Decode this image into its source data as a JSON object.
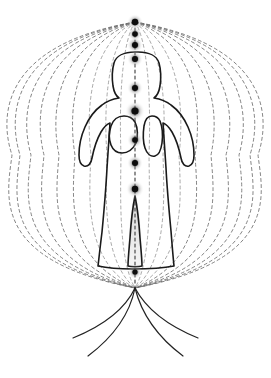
{
  "document": {
    "title": "Human Energy Field Diagram",
    "background_color": "#ffffff",
    "width": 271,
    "height": 378
  },
  "colors": {
    "figure_outline": "#1a1a1a",
    "field_line": "#6e6e6e",
    "inner_field_line": "#8a8a8a",
    "axis_line": "#3a3a3a",
    "node_core": "#0d0d0d",
    "node_glow": "#b5b5b5",
    "grounding_line": "#232323",
    "inner_beam": "#d8d8d8"
  },
  "canvas": {
    "center_x": 135,
    "top_pole": {
      "x": 135,
      "y": 22
    },
    "bottom_pole": {
      "x": 135,
      "y": 288
    }
  },
  "figure": {
    "name": "standing-human-silhouette",
    "pose": "arms akimbo, hands on hips",
    "stroke_width": 1.6,
    "outline_path": "M 135 52 C 124 52 116 56 114 63 C 112 70 112 79 113 86 C 114 92 116 96 119 98 C 113 99 107 101 102 105 C 95 110 89 118 85 127 C 81 136 79 146 79 155 C 79 161 81 165 84 166 C 88 167 91 164 92 158 C 94 148 97 139 101 132 C 104 127 107 124 110 123 C 109 136 108 152 107 168 C 106 188 104 211 102 232 C 100 248 99 258 98 266 C 107 268 119 269 133 269 C 150 269 164 268 174 266 C 173 256 172 244 171 231 C 169 210 167 188 166 168 C 165 152 164 136 163 123 C 166 124 169 127 172 132 C 176 139 179 148 181 158 C 182 164 185 167 189 166 C 192 165 194 161 194 155 C 194 146 192 136 188 127 C 184 118 178 110 171 105 C 166 101 160 99 154 98 C 157 96 159 92 160 86 C 161 79 161 70 159 63 C 157 56 149 52 138 52 Z",
    "left_arm_gap_path": "M 124 116 C 118 116 113 120 111 126 C 109 132 109 140 111 145 C 113 150 117 153 122 153 C 128 153 133 149 136 143 C 138 137 138 128 135 122 C 132 117 128 116 124 116 Z",
    "right_arm_gap_path": "M 152 116 C 148 116 145 120 144 126 C 143 133 143 142 145 148 C 147 154 151 157 155 156 C 159 155 161 150 162 143 C 163 135 162 126 160 121 C 158 117 155 116 152 116 Z",
    "leg_gap_path": "M 135 196 C 133 206 131 222 130 238 C 129 250 128 259 128 266 C 131 267 139 267 142 266 C 142 259 141 250 140 238 C 139 222 137 206 135 196 Z"
  },
  "field": {
    "name": "toroidal-energy-field",
    "description": "Dashed ovoid field lines converging at the crown and root poles",
    "line_count": 15,
    "dash_pattern": "3 3",
    "stroke_width": 0.9,
    "half_widths": [
      123,
      115,
      104,
      91,
      76,
      60,
      44,
      28,
      14,
      0
    ],
    "top_y": 22,
    "bottom_y": 288
  },
  "axis": {
    "name": "central-channel",
    "dash_pattern": "3 3",
    "stroke_width": 1.1,
    "x": 135,
    "y_start": 22,
    "y_end": 288
  },
  "nodes": {
    "name": "energy-centers",
    "count": 10,
    "points": [
      {
        "label": "node-1",
        "x": 135,
        "y": 22,
        "r": 3.2,
        "glow": 8
      },
      {
        "label": "node-2",
        "x": 135,
        "y": 34,
        "r": 2.8,
        "glow": 7
      },
      {
        "label": "node-3",
        "x": 135,
        "y": 45,
        "r": 3.0,
        "glow": 8
      },
      {
        "label": "node-4",
        "x": 135,
        "y": 59,
        "r": 3.0,
        "glow": 8
      },
      {
        "label": "node-5",
        "x": 135,
        "y": 88,
        "r": 3.0,
        "glow": 8
      },
      {
        "label": "node-6",
        "x": 135,
        "y": 111,
        "r": 3.6,
        "glow": 10
      },
      {
        "label": "node-7",
        "x": 135,
        "y": 140,
        "r": 2.8,
        "glow": 8
      },
      {
        "label": "node-8",
        "x": 135,
        "y": 163,
        "r": 3.0,
        "glow": 8
      },
      {
        "label": "node-9",
        "x": 135,
        "y": 189,
        "r": 3.2,
        "glow": 9
      },
      {
        "label": "node-10",
        "x": 135,
        "y": 272,
        "r": 2.6,
        "glow": 7
      }
    ]
  },
  "grounding": {
    "name": "grounding-cords",
    "origin": {
      "x": 135,
      "y": 288
    },
    "count": 4,
    "stroke_width": 1.2,
    "paths": [
      "M 135 288 C 127 305 110 323 73 338",
      "M 135 288 C 131 308 120 332 88 356",
      "M 135 288 C 140 308 151 332 183 356",
      "M 135 288 C 144 305 161 323 198 338"
    ]
  },
  "beam": {
    "name": "inner-light-beam",
    "path": "M 135 191 C 131 208 128 236 128 262 C 130 268 140 268 142 262 C 142 236 139 208 135 191 Z"
  }
}
